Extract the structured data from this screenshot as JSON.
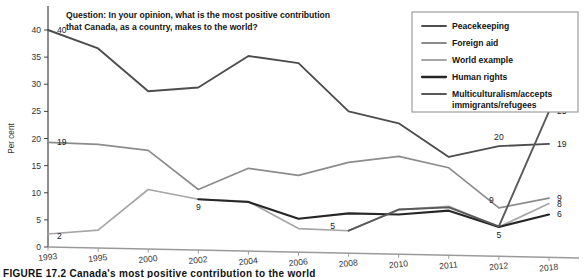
{
  "figure": {
    "caption": "FIGURE 17.2  Canada's most positive contribution to the world",
    "question": "Question: In your opinion, what is the most positive contribution that Canada, as a country, makes to the world?",
    "question_line1": "Question: In your opinion, what is the most positive contribution",
    "question_line2": "that Canada, as a country, makes to the world?"
  },
  "chart_data": {
    "type": "line",
    "xlabel": "",
    "ylabel": "Per cent",
    "ylim": [
      0,
      40
    ],
    "yticks": [
      0,
      5,
      10,
      15,
      20,
      25,
      30,
      35,
      40
    ],
    "grid": false,
    "legend_position": "top-right",
    "categories": [
      "1993",
      "1995",
      "2000",
      "2002",
      "2004",
      "2006",
      "2008",
      "2010",
      "2011",
      "2012",
      "2018"
    ],
    "series": [
      {
        "name": "Peacekeeping",
        "color": "#4d4d4d",
        "width": 1.9,
        "values": [
          40,
          36.6,
          28.7,
          29.4,
          35.2,
          33.9,
          25.0,
          22.8,
          16.6,
          18.6,
          19
        ]
      },
      {
        "name": "Foreign aid",
        "color": "#8c8c8c",
        "width": 1.7,
        "values": [
          19.3,
          18.9,
          17.8,
          10.6,
          14.5,
          13.2,
          15.6,
          16.7,
          14.6,
          7.2,
          9
        ]
      },
      {
        "name": "World example",
        "color": "#a6a6a6",
        "width": 1.7,
        "values": [
          2.4,
          3.1,
          10.6,
          8.8,
          8.4,
          3.4,
          3.0,
          6.9,
          7.5,
          3.7,
          8
        ]
      },
      {
        "name": "Human rights",
        "color": "#262626",
        "width": 2.1,
        "values": [
          null,
          null,
          null,
          8.8,
          8.3,
          5.2,
          6.2,
          6.0,
          6.7,
          3.7,
          6
        ]
      },
      {
        "name": "Multiculturalism/accepts immigrants/refugees",
        "color": "#595959",
        "width": 1.9,
        "values": [
          null,
          null,
          null,
          null,
          null,
          null,
          3.0,
          6.9,
          7.3,
          3.8,
          25
        ]
      }
    ],
    "annotations": [
      {
        "text": "40",
        "series": "Peacekeeping",
        "x": "1993",
        "value": 40,
        "pos": "right"
      },
      {
        "text": "19",
        "series": "Foreign aid",
        "x": "1993",
        "value": 19.3,
        "pos": "right"
      },
      {
        "text": "2",
        "series": "World example",
        "x": "1993",
        "value": 2.4,
        "pos": "right-below"
      },
      {
        "text": "9",
        "series": "World example",
        "x": "2002",
        "value": 8.8,
        "pos": "below"
      },
      {
        "text": "5",
        "series": "Human rights",
        "x": "2008",
        "value": 3.0,
        "pos": "left-above"
      },
      {
        "text": "20",
        "series": "Peacekeeping",
        "x": "2012",
        "value": 18.6,
        "pos": "above"
      },
      {
        "text": "9",
        "series": "Foreign aid",
        "x": "2012",
        "value": 7.2,
        "pos": "above-left"
      },
      {
        "text": "5",
        "series": "Human rights",
        "x": "2012",
        "value": 3.7,
        "pos": "below"
      },
      {
        "text": "25",
        "series": "Multiculturalism/accepts immigrants/refugees",
        "x": "2018",
        "value": 25,
        "pos": "end"
      },
      {
        "text": "19",
        "series": "Peacekeeping",
        "x": "2018",
        "value": 19,
        "pos": "end"
      },
      {
        "text": "9",
        "series": "Foreign aid",
        "x": "2018",
        "value": 9,
        "pos": "end"
      },
      {
        "text": "8",
        "series": "World example",
        "x": "2018",
        "value": 8,
        "pos": "end"
      },
      {
        "text": "6",
        "series": "Human rights",
        "x": "2018",
        "value": 6,
        "pos": "end"
      }
    ]
  },
  "legend": {
    "items": [
      {
        "label": "Peacekeeping",
        "color": "#4d4d4d"
      },
      {
        "label": "Foreign aid",
        "color": "#8c8c8c"
      },
      {
        "label": "World example",
        "color": "#a6a6a6"
      },
      {
        "label": "Human rights",
        "color": "#262626"
      },
      {
        "label": "Multiculturalism/accepts",
        "label2": "immigrants/refugees",
        "color": "#595959"
      }
    ]
  }
}
